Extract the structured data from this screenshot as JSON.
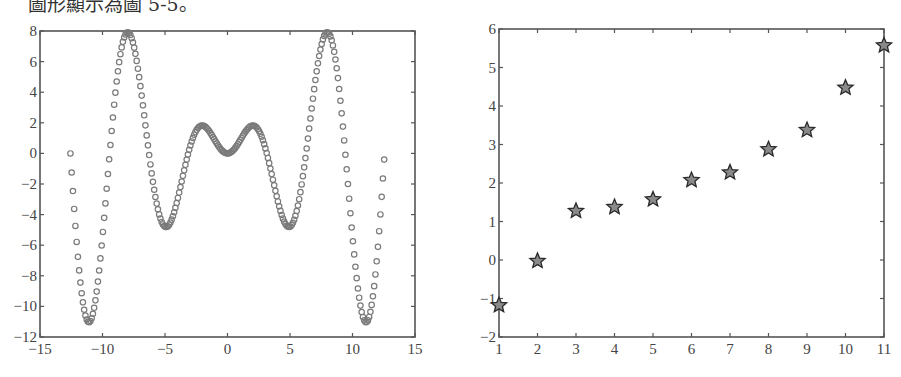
{
  "caption": "圖形顯示為圖 5-5。",
  "chart_data": [
    {
      "type": "scatter",
      "title": "",
      "xlabel": "",
      "ylabel": "",
      "function": "y = x·sin(x)",
      "x_range": [
        -12.566,
        12.566
      ],
      "x_step": 0.1,
      "marker": "circle",
      "marker_color": "#7a7a7a",
      "xlim": [
        -15,
        15
      ],
      "ylim": [
        -12,
        8
      ],
      "xticks": [
        -15,
        -10,
        -5,
        0,
        5,
        10,
        15
      ],
      "xtick_labels": [
        "−15",
        "−10",
        "−5",
        "0",
        "5",
        "10",
        "15"
      ],
      "yticks": [
        -12,
        -10,
        -8,
        -6,
        -4,
        -2,
        0,
        2,
        4,
        6,
        8
      ],
      "ytick_labels": [
        "−12",
        "−10",
        "−8",
        "−6",
        "−4",
        "−2",
        "0",
        "2",
        "4",
        "6",
        "8"
      ],
      "grid": false,
      "legend": "none"
    },
    {
      "type": "scatter",
      "title": "",
      "xlabel": "",
      "ylabel": "",
      "x": [
        1,
        2,
        3,
        4,
        5,
        6,
        7,
        8,
        9,
        10,
        11
      ],
      "y": [
        -1.15,
        0.0,
        1.3,
        1.4,
        1.6,
        2.1,
        2.3,
        2.9,
        3.4,
        4.5,
        5.6
      ],
      "marker": "pentagram",
      "marker_color": "#8a8a8a",
      "xlim": [
        1,
        11
      ],
      "ylim": [
        -2,
        6
      ],
      "xticks": [
        1,
        2,
        3,
        4,
        5,
        6,
        7,
        8,
        9,
        10,
        11
      ],
      "xtick_labels": [
        "1",
        "2",
        "3",
        "4",
        "5",
        "6",
        "7",
        "8",
        "9",
        "10",
        "11"
      ],
      "yticks": [
        -2,
        -1,
        0,
        1,
        2,
        3,
        4,
        5,
        6
      ],
      "ytick_labels": [
        "−2",
        "−1",
        "0",
        "1",
        "2",
        "3",
        "4",
        "5",
        "6"
      ],
      "grid": false,
      "legend": "none"
    }
  ]
}
